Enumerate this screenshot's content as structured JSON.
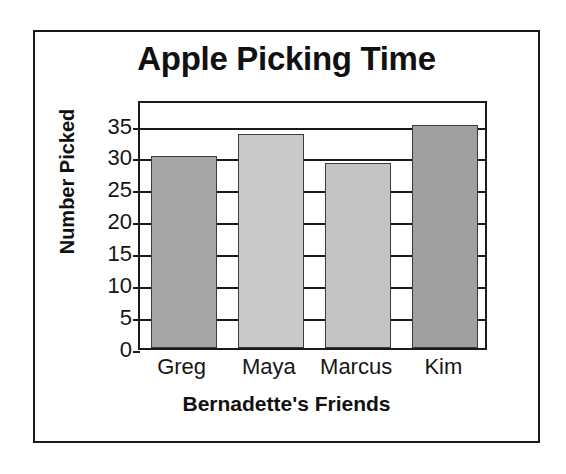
{
  "figure": {
    "background_color": "#ffffff",
    "frame_color": "#1a1a1a"
  },
  "chart_data": {
    "type": "bar",
    "title": "Apple Picking Time",
    "xlabel": "Bernadette's Friends",
    "ylabel": "Number Picked",
    "categories": [
      "Greg",
      "Maya",
      "Marcus",
      "Kim"
    ],
    "values": [
      30,
      33.5,
      29,
      35
    ],
    "bar_colors": [
      "#a5a5a5",
      "#c9c9c9",
      "#c4c4c4",
      "#a0a0a0"
    ],
    "bar_edge_color": "#3c3c3c",
    "ylim": [
      0,
      39
    ],
    "yticks": [
      0,
      5,
      10,
      15,
      20,
      25,
      30,
      35
    ],
    "ytick_labels": [
      "0",
      "5",
      "10",
      "15",
      "20",
      "25",
      "30",
      "35"
    ],
    "grid": true,
    "grid_axis": "y",
    "grid_color": "#1a1a1a",
    "legend": false,
    "legend_position": "none"
  }
}
